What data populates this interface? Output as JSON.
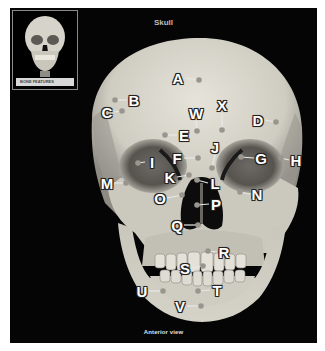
{
  "title": "Skull",
  "caption": "Anterior view",
  "thumbnail": {
    "label": "BONE FEATURES"
  },
  "colors": {
    "background": "#050505",
    "bone": "#d9d6cc",
    "label_text": "#ffffff",
    "leader_line": "#e8e8e8"
  },
  "labels": [
    {
      "id": "A",
      "text": "A"
    },
    {
      "id": "B",
      "text": "B"
    },
    {
      "id": "C",
      "text": "C"
    },
    {
      "id": "D",
      "text": "D"
    },
    {
      "id": "E",
      "text": "E"
    },
    {
      "id": "F",
      "text": "F"
    },
    {
      "id": "G",
      "text": "G"
    },
    {
      "id": "H",
      "text": "H"
    },
    {
      "id": "I",
      "text": "I"
    },
    {
      "id": "J",
      "text": "J"
    },
    {
      "id": "K",
      "text": "K"
    },
    {
      "id": "L",
      "text": "L"
    },
    {
      "id": "M",
      "text": "M"
    },
    {
      "id": "N",
      "text": "N"
    },
    {
      "id": "O",
      "text": "O"
    },
    {
      "id": "P",
      "text": "P"
    },
    {
      "id": "Q",
      "text": "Q"
    },
    {
      "id": "R",
      "text": "R"
    },
    {
      "id": "S",
      "text": "S"
    },
    {
      "id": "T",
      "text": "T"
    },
    {
      "id": "U",
      "text": "U"
    },
    {
      "id": "V",
      "text": "V"
    },
    {
      "id": "W",
      "text": "W"
    },
    {
      "id": "X",
      "text": "X"
    }
  ]
}
